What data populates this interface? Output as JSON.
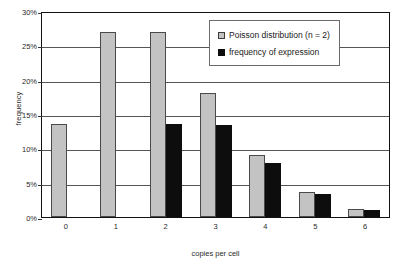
{
  "chart_data": {
    "type": "bar",
    "title": "",
    "xlabel": "copies per cell",
    "ylabel": "frequency",
    "categories": [
      "0",
      "1",
      "2",
      "3",
      "4",
      "5",
      "6"
    ],
    "series": [
      {
        "name": "Poisson distribution (n = 2)",
        "color": "#c3c3c3",
        "values": [
          13.5,
          27.0,
          27.0,
          18.0,
          9.0,
          3.6,
          1.1
        ]
      },
      {
        "name": "frequency of expression",
        "color": "#0d0d0d",
        "values": [
          0,
          0,
          13.5,
          13.4,
          7.8,
          3.3,
          1.0
        ]
      }
    ],
    "ylim": [
      0,
      30
    ],
    "ytick_values": [
      0,
      5,
      10,
      15,
      20,
      25,
      30
    ],
    "ytick_labels": [
      "0%",
      "5%",
      "10%",
      "15%",
      "20%",
      "25%",
      "30%"
    ],
    "grid": true,
    "legend_position": "top-right"
  },
  "legend": {
    "entries": [
      {
        "label": "Poisson distribution (n = 2)",
        "swatch": "light-gray"
      },
      {
        "label": "frequency of expression",
        "swatch": "black"
      }
    ]
  }
}
